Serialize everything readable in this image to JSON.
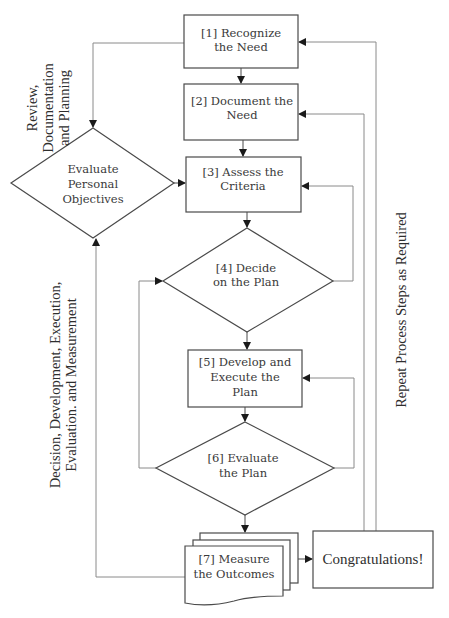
{
  "diagram": {
    "side_labels": {
      "top_left": [
        "Review,",
        "Documentation",
        "and Planning"
      ],
      "bottom_left": [
        "Decision, Development, Execution,",
        "Evaluation. and Measurement"
      ],
      "right": "Repeat Process Steps as Required"
    },
    "nodes": {
      "step1": [
        "[1] Recognize",
        "the Need"
      ],
      "step2": [
        "[2] Document the",
        "Need"
      ],
      "step3": [
        "[3] Assess the",
        "Criteria"
      ],
      "step4": [
        "[4] Decide",
        "on the Plan"
      ],
      "step5": [
        "[5] Develop and",
        "Execute the",
        "Plan"
      ],
      "step6": [
        "[6] Evaluate",
        "the Plan"
      ],
      "step7": [
        "[7] Measure",
        "the Outcomes"
      ],
      "objectives": [
        "Evaluate",
        "Personal",
        "Objectives"
      ],
      "congrats": "Congratulations!"
    },
    "edges": [
      {
        "from": "step1",
        "to": "step2"
      },
      {
        "from": "step2",
        "to": "step3"
      },
      {
        "from": "step3",
        "to": "step4"
      },
      {
        "from": "step4",
        "to": "step5"
      },
      {
        "from": "step5",
        "to": "step6"
      },
      {
        "from": "step6",
        "to": "step7"
      },
      {
        "from": "step7",
        "to": "congrats"
      },
      {
        "from": "step1",
        "to": "objectives"
      },
      {
        "from": "objectives",
        "to": "step3"
      },
      {
        "from": "step7",
        "to": "objectives"
      },
      {
        "from": "step4",
        "to": "step3"
      },
      {
        "from": "step6",
        "to": "step5"
      },
      {
        "from": "step6",
        "to": "step4"
      },
      {
        "from": "congrats",
        "to": "step1"
      },
      {
        "from": "congrats",
        "to": "step2"
      }
    ]
  }
}
